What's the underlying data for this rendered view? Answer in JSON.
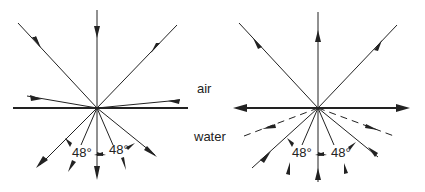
{
  "labels": {
    "air": "air",
    "water": "water"
  },
  "left_diagram": {
    "description": "Light rays entering water from air: all directions in air refract into a cone of ±48° below the surface",
    "angle_left": "48°",
    "angle_right": "48°"
  },
  "right_diagram": {
    "description": "Light rays from under water: rays within ±48° escape into air; rays beyond are totally internally reflected (dashed)",
    "angle_left": "48°",
    "angle_right": "48°"
  },
  "colors": {
    "line": "#222222",
    "background": "#ffffff"
  }
}
